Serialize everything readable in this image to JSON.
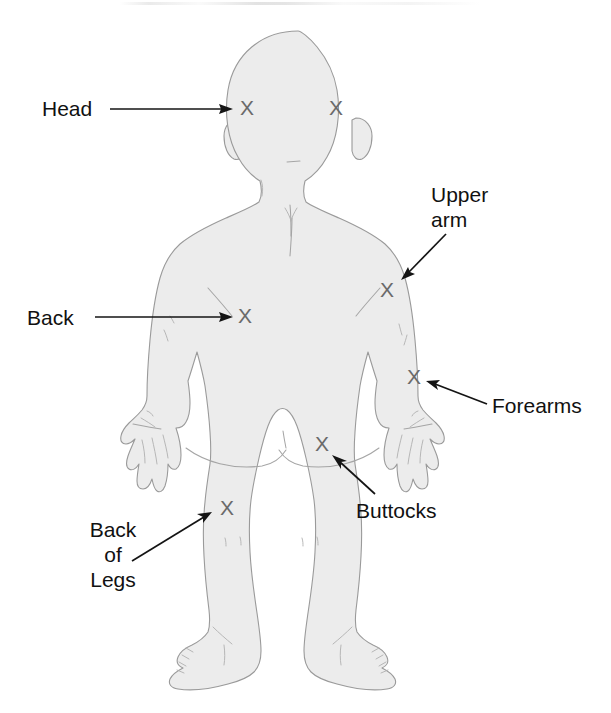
{
  "figure": {
    "view": "posterior",
    "width": 611,
    "height": 713,
    "background_color": "#ffffff",
    "body_fill_color": "#ececec",
    "body_outline_color": "#9a9a9a",
    "marker_color": "#6a6a6a",
    "leader_color": "#141414",
    "label_color": "#111111",
    "marker_glyph": "X"
  },
  "labels": [
    {
      "id": "head",
      "text": "Head",
      "align": "left",
      "x": 42,
      "y": 96
    },
    {
      "id": "upper_arm",
      "text": "Upper\narm",
      "align": "left",
      "x": 431,
      "y": 182
    },
    {
      "id": "back",
      "text": "Back",
      "align": "left",
      "x": 27,
      "y": 305
    },
    {
      "id": "forearms",
      "text": "Forearms",
      "align": "left",
      "x": 492,
      "y": 393
    },
    {
      "id": "buttocks",
      "text": "Buttocks",
      "align": "left",
      "x": 356,
      "y": 498
    },
    {
      "id": "back_of_legs",
      "text": "Back\nof\nLegs",
      "align": "center",
      "x": 76,
      "y": 517
    }
  ],
  "markers": [
    {
      "id": "head-left",
      "region": "Head",
      "x": 247,
      "y": 109
    },
    {
      "id": "head-right",
      "region": "Head",
      "x": 336,
      "y": 109
    },
    {
      "id": "upper-arm",
      "region": "Upper arm",
      "x": 387,
      "y": 291
    },
    {
      "id": "back",
      "region": "Back",
      "x": 245,
      "y": 317
    },
    {
      "id": "forearm",
      "region": "Forearms",
      "x": 414,
      "y": 378
    },
    {
      "id": "buttocks",
      "region": "Buttocks",
      "x": 322,
      "y": 445
    },
    {
      "id": "back-of-legs",
      "region": "Back of Legs",
      "x": 227,
      "y": 509
    }
  ],
  "leaders": [
    {
      "id": "head",
      "from": [
        110,
        109
      ],
      "to": [
        231,
        109
      ]
    },
    {
      "id": "upper_arm",
      "from": [
        444,
        236
      ],
      "to": [
        402,
        279
      ]
    },
    {
      "id": "back",
      "from": [
        95,
        317
      ],
      "to": [
        231,
        317
      ]
    },
    {
      "id": "forearms",
      "from": [
        487,
        404
      ],
      "to": [
        427,
        381
      ]
    },
    {
      "id": "buttocks",
      "from": [
        374,
        493
      ],
      "to": [
        333,
        456
      ]
    },
    {
      "id": "back_of_legs",
      "from": [
        132,
        561
      ],
      "to": [
        211,
        512
      ]
    }
  ]
}
